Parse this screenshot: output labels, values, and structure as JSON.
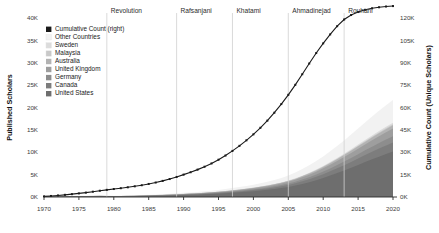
{
  "chart_data": {
    "type": "area",
    "title": "",
    "subtitle": "",
    "xlabel": "",
    "ylabel": "Published Scholars",
    "y2label": "Cumulative Count (Unique Scholars)",
    "xlim": [
      1970,
      2020
    ],
    "ylim": [
      0,
      40000
    ],
    "y2lim": [
      0,
      120000
    ],
    "grid": false,
    "legend_position": "top-left",
    "stacked": true,
    "x_ticks": [
      "1970",
      "1975",
      "1980",
      "1985",
      "1990",
      "1995",
      "2000",
      "2005",
      "2010",
      "2015",
      "2020"
    ],
    "x_tick_values": [
      1970,
      1975,
      1980,
      1985,
      1990,
      1995,
      2000,
      2005,
      2010,
      2015,
      2020
    ],
    "y_ticks": [
      "0K",
      "5K",
      "10K",
      "15K",
      "20K",
      "25K",
      "30K",
      "35K",
      "40K"
    ],
    "y_tick_values": [
      0,
      5000,
      10000,
      15000,
      20000,
      25000,
      30000,
      35000,
      40000
    ],
    "y2_ticks": [
      "0K",
      "15K",
      "30K",
      "45K",
      "60K",
      "75K",
      "90K",
      "105K",
      "120K"
    ],
    "y2_tick_values": [
      0,
      15000,
      30000,
      45000,
      60000,
      75000,
      90000,
      105000,
      120000
    ],
    "x": [
      1970,
      1971,
      1972,
      1973,
      1974,
      1975,
      1976,
      1977,
      1978,
      1979,
      1980,
      1981,
      1982,
      1983,
      1984,
      1985,
      1986,
      1987,
      1988,
      1989,
      1990,
      1991,
      1992,
      1993,
      1994,
      1995,
      1996,
      1997,
      1998,
      1999,
      2000,
      2001,
      2002,
      2003,
      2004,
      2005,
      2006,
      2007,
      2008,
      2009,
      2010,
      2011,
      2012,
      2013,
      2014,
      2015,
      2016,
      2017,
      2018,
      2019,
      2020
    ],
    "series": [
      {
        "name": "United States",
        "color": "#6e6e6e",
        "values": [
          60,
          70,
          80,
          95,
          110,
          125,
          140,
          155,
          165,
          150,
          140,
          145,
          160,
          180,
          205,
          235,
          265,
          300,
          340,
          385,
          435,
          480,
          530,
          590,
          660,
          740,
          830,
          930,
          1040,
          1160,
          1290,
          1440,
          1600,
          1790,
          2000,
          2250,
          2560,
          2920,
          3320,
          3760,
          4250,
          4780,
          5340,
          5930,
          6540,
          7170,
          7800,
          8420,
          9020,
          9600,
          10150
        ]
      },
      {
        "name": "Canada",
        "color": "#7d7d7d",
        "values": [
          12,
          14,
          16,
          19,
          22,
          25,
          28,
          31,
          33,
          30,
          28,
          29,
          32,
          36,
          41,
          47,
          53,
          60,
          68,
          77,
          87,
          96,
          106,
          118,
          132,
          148,
          166,
          186,
          208,
          232,
          258,
          288,
          320,
          358,
          400,
          450,
          512,
          584,
          664,
          752,
          850,
          956,
          1068,
          1186,
          1308,
          1434,
          1560,
          1684,
          1804,
          1920,
          2030
        ]
      },
      {
        "name": "Germany",
        "color": "#8d8d8d",
        "values": [
          8,
          9,
          11,
          13,
          15,
          17,
          19,
          21,
          22,
          20,
          19,
          20,
          22,
          24,
          28,
          32,
          36,
          41,
          46,
          52,
          59,
          65,
          72,
          80,
          90,
          100,
          113,
          126,
          141,
          158,
          175,
          196,
          218,
          243,
          272,
          306,
          348,
          397,
          451,
          511,
          578,
          650,
          726,
          806,
          889,
          975,
          1060,
          1145,
          1226,
          1305,
          1380
        ]
      },
      {
        "name": "United Kingdom",
        "color": "#9e9e9e",
        "values": [
          10,
          12,
          14,
          16,
          19,
          21,
          24,
          26,
          28,
          25,
          24,
          25,
          27,
          31,
          35,
          40,
          45,
          51,
          58,
          66,
          74,
          82,
          90,
          100,
          112,
          126,
          141,
          158,
          177,
          197,
          219,
          245,
          272,
          304,
          340,
          382,
          435,
          496,
          564,
          639,
          722,
          812,
          907,
          1008,
          1111,
          1219,
          1325,
          1431,
          1533,
          1632,
          1725
        ]
      },
      {
        "name": "Australia",
        "color": "#b3b3b3",
        "values": [
          4,
          5,
          6,
          7,
          8,
          9,
          10,
          11,
          12,
          11,
          10,
          11,
          12,
          13,
          15,
          17,
          19,
          22,
          25,
          28,
          32,
          35,
          39,
          43,
          48,
          54,
          61,
          68,
          76,
          85,
          94,
          105,
          117,
          131,
          146,
          164,
          187,
          213,
          242,
          274,
          310,
          348,
          389,
          432,
          477,
          523,
          568,
          614,
          657,
          700,
          740
        ]
      },
      {
        "name": "Malaysia",
        "color": "#c9c9c9",
        "values": [
          1,
          1,
          1,
          2,
          2,
          2,
          3,
          3,
          3,
          3,
          3,
          3,
          3,
          4,
          4,
          5,
          6,
          6,
          7,
          8,
          9,
          10,
          11,
          12,
          14,
          15,
          17,
          19,
          22,
          24,
          27,
          30,
          34,
          38,
          42,
          47,
          54,
          61,
          70,
          79,
          89,
          100,
          112,
          124,
          137,
          150,
          163,
          176,
          189,
          201,
          212
        ]
      },
      {
        "name": "Sweden",
        "color": "#dcdcdc",
        "values": [
          2,
          2,
          3,
          3,
          4,
          4,
          5,
          5,
          6,
          5,
          5,
          5,
          6,
          6,
          7,
          8,
          9,
          10,
          12,
          13,
          15,
          16,
          18,
          20,
          22,
          25,
          28,
          32,
          35,
          40,
          44,
          49,
          55,
          61,
          68,
          77,
          87,
          99,
          113,
          128,
          145,
          163,
          182,
          202,
          223,
          244,
          265,
          287,
          307,
          326,
          345
        ]
      },
      {
        "name": "Other Countries",
        "color": "#f2f2f2",
        "values": [
          30,
          35,
          40,
          47,
          55,
          62,
          70,
          78,
          83,
          75,
          70,
          72,
          80,
          90,
          102,
          117,
          132,
          150,
          170,
          192,
          217,
          240,
          265,
          295,
          330,
          370,
          415,
          465,
          520,
          580,
          645,
          720,
          800,
          895,
          1000,
          1125,
          1280,
          1460,
          1660,
          1880,
          2125,
          2390,
          2670,
          2965,
          3270,
          3585,
          3900,
          4210,
          4510,
          4800,
          5075
        ]
      }
    ],
    "cumulative": {
      "name": "Cumulative Count (right)",
      "color": "#1a1a1a",
      "axis": "right",
      "marker": "square",
      "values": [
        400,
        700,
        1050,
        1450,
        1900,
        2400,
        2950,
        3550,
        4200,
        4800,
        5350,
        5900,
        6500,
        7150,
        7900,
        8750,
        9700,
        10800,
        12050,
        13450,
        15000,
        16600,
        18350,
        20300,
        22500,
        25000,
        27800,
        30900,
        34300,
        38000,
        42000,
        46400,
        51200,
        56500,
        62300,
        68500,
        75200,
        82300,
        89500,
        96500,
        103000,
        109000,
        114500,
        119000,
        122000,
        124000,
        125500,
        126500,
        127200,
        127700,
        128000
      ]
    },
    "eras": [
      {
        "label": "Revolution",
        "x": 1979
      },
      {
        "label": "Rafsanjani",
        "x": 1989
      },
      {
        "label": "Khatami",
        "x": 1997
      },
      {
        "label": "Ahmadinejad",
        "x": 2005
      },
      {
        "label": "Rouhani",
        "x": 2013
      }
    ],
    "era_dividers": [
      1979,
      1989,
      1997,
      2005,
      2013
    ],
    "legend": [
      {
        "label": "Cumulative Count (right)",
        "color": "#1a1a1a"
      },
      {
        "label": "Other Countries",
        "color": "#f2f2f2"
      },
      {
        "label": "Sweden",
        "color": "#dcdcdc"
      },
      {
        "label": "Malaysia",
        "color": "#c9c9c9"
      },
      {
        "label": "Australia",
        "color": "#b3b3b3"
      },
      {
        "label": "United Kingdom",
        "color": "#9e9e9e"
      },
      {
        "label": "Germany",
        "color": "#8d8d8d"
      },
      {
        "label": "Canada",
        "color": "#7d7d7d"
      },
      {
        "label": "United States",
        "color": "#6e6e6e"
      }
    ]
  }
}
